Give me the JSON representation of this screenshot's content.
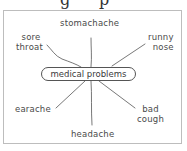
{
  "diagram": {
    "type": "mind-map",
    "center": {
      "label": "medical problems"
    },
    "branches": [
      {
        "id": "stomachache",
        "label": "stomachache"
      },
      {
        "id": "sore-throat",
        "line1": "sore",
        "line2": "throat"
      },
      {
        "id": "runny-nose",
        "line1": "runny",
        "line2": "nose"
      },
      {
        "id": "earache",
        "label": "earache"
      },
      {
        "id": "headache",
        "label": "headache"
      },
      {
        "id": "bad-cough",
        "line1": "bad",
        "line2": "cough"
      }
    ]
  },
  "colors": {
    "frame_border": "#bdbdbd",
    "lines": "#555555",
    "text": "#4a4a4a"
  }
}
